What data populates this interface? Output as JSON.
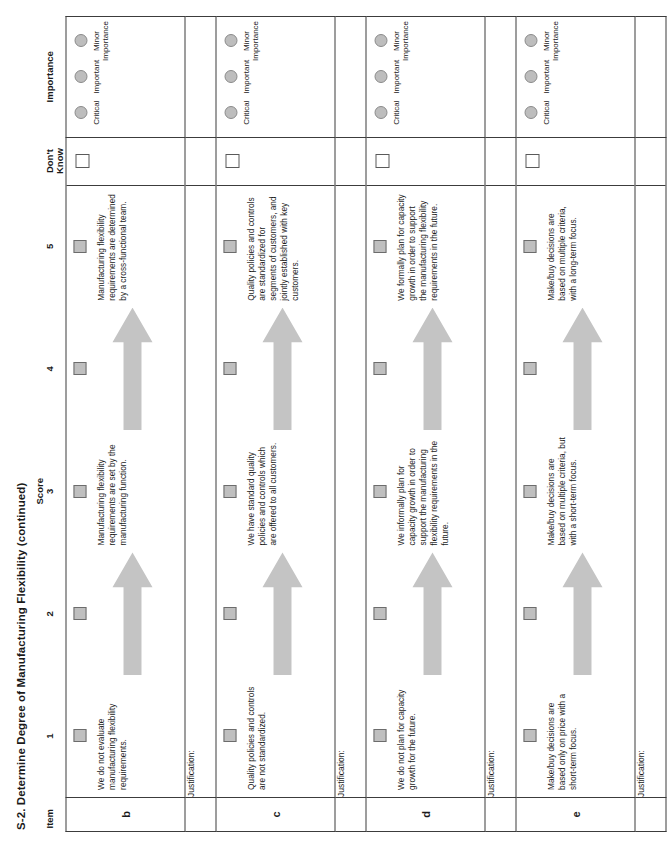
{
  "document": {
    "title": "S-2. Determine Degree of Manufacturing Flexibility (continued)"
  },
  "header": {
    "item": "Item",
    "score_group": "Score",
    "score_columns": [
      "1",
      "2",
      "3",
      "4",
      "5"
    ],
    "dont_know": "Don't\nKnow",
    "dont_know_line1": "Don't",
    "dont_know_line2": "Know",
    "importance": "Importance"
  },
  "importance_options": [
    {
      "label": "Critical"
    },
    {
      "label": "Important"
    },
    {
      "label": "Minor\nImportance"
    }
  ],
  "justification_label": "Justification:",
  "rows": [
    {
      "item": "b",
      "score1_text": "We do not evaluate manufacturing flexibility requirements.",
      "score3_text": "Manufacturing flexibility requirements are set by the manufacturing function.",
      "score5_text": "Manufacturing flexibility requirements are determined by a cross-functional team."
    },
    {
      "item": "c",
      "score1_text": "Quality policies and controls are not standardized.",
      "score3_text": "We have standard quality policies and controls which are offered to all customers.",
      "score5_text": "Quality policies and controls are standardized for segments of customers, and jointly established with key customers."
    },
    {
      "item": "d",
      "score1_text": "We do not plan for capacity growth for the future.",
      "score3_text": "We informally plan for capacity growth in order to support the manufacturing flexibility requirements in the future.",
      "score5_text": "We formally plan for capacity growth in order to support the manufacturing flexibility requirements in the future."
    },
    {
      "item": "e",
      "score1_text": "Make/buy decisions are based only on price with a short-term focus.",
      "score3_text": "Make/buy decisions are based on multiple criteria, but with a short-term focus.",
      "score5_text": "Make/buy decisions are based on multiple criteria, with a long-term focus."
    }
  ],
  "colors": {
    "checkbox_fill": "#bfbfbf",
    "radio_fill": "#bdbdbd",
    "arrow_fill": "#c4c4c4",
    "border": "#3c3c3c",
    "text": "#1a1a1a",
    "page_background": "#ffffff"
  }
}
